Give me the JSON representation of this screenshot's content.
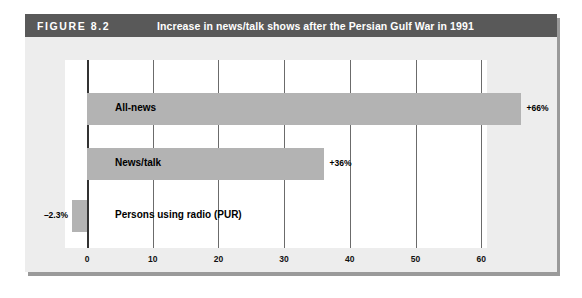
{
  "figure": {
    "number_label": "FIGURE 8.2",
    "title": "Increase in news/talk shows after the Persian Gulf War in 1991"
  },
  "chart_data": {
    "type": "bar",
    "orientation": "horizontal",
    "title": "Increase in news/talk shows after the Persian Gulf War in 1991",
    "xlabel": "",
    "ylabel": "",
    "xlim": [
      -5,
      66
    ],
    "xticks": [
      "0",
      "10",
      "20",
      "30",
      "40",
      "50",
      "60"
    ],
    "xtick_values": [
      0,
      10,
      20,
      30,
      40,
      50,
      60
    ],
    "grid": true,
    "legend": "none",
    "categories": [
      "All-news",
      "News/talk",
      "Persons using radio (PUR)"
    ],
    "values": [
      66,
      36,
      -2.3
    ],
    "value_labels": [
      "+66%",
      "+36%",
      "–2.3%"
    ],
    "bar_color": "#b3b3b3",
    "plot_background": "#ffffff",
    "panel_background": "#ededed",
    "title_bar_color": "#595959"
  }
}
